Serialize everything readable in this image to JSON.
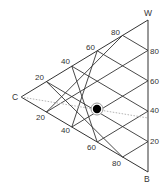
{
  "diagram": {
    "type": "ternary",
    "vertices": {
      "C": {
        "label": "C",
        "x": 21,
        "y": 97
      },
      "W": {
        "label": "W",
        "x": 148,
        "y": 20
      },
      "B": {
        "label": "B",
        "x": 148,
        "y": 172
      }
    },
    "edge_labels": {
      "top_left": [
        "20",
        "40",
        "60",
        "80"
      ],
      "bottom_left": [
        "20",
        "40",
        "60",
        "80"
      ],
      "right": [
        "20",
        "40",
        "60",
        "80"
      ]
    },
    "point": {
      "name": "sample-point",
      "color": "#000000",
      "ring_color": "#999999"
    },
    "guide_line": {
      "style": "dashed",
      "color": "#aaaaaa"
    },
    "colors": {
      "line": "#333333",
      "text": "#333333"
    }
  }
}
